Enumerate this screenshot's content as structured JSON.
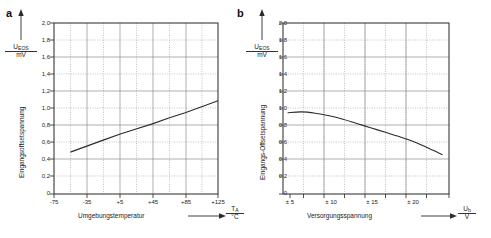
{
  "figure": {
    "panels": [
      {
        "letter": "a",
        "y_axis": {
          "numerator": "U",
          "numerator_sub": "EOS",
          "denominator": "mV",
          "rotated_label": "Eingangsoffsetspannung",
          "ticks": [
            "2,0",
            "1,8",
            "1,6",
            "1,4",
            "1,2",
            "1,0",
            "0,8",
            "0,6",
            "0,4",
            "0,2",
            "0"
          ]
        },
        "x_axis": {
          "label": "Umgebungstemperatur",
          "numerator": "T",
          "numerator_sub": "A",
          "denominator": "°C",
          "ticks": [
            "-75",
            "-35",
            "+5",
            "+45",
            "+85",
            "+125"
          ]
        }
      },
      {
        "letter": "b",
        "y_axis": {
          "numerator": "U",
          "numerator_sub": "EOS",
          "denominator": "mV",
          "rotated_label": "Eingangs-Offsetspannung",
          "ticks": [
            "2,0",
            "1,8",
            "1,6",
            "1,4",
            "1,2",
            "1,0",
            "0,8",
            "0,6",
            "0,4",
            "0,2",
            "0"
          ]
        },
        "x_axis": {
          "label": "Versorgungsspannung",
          "numerator": "U",
          "numerator_sub": "b",
          "denominator": "V",
          "ticks": [
            "± 5",
            "± 10",
            "± 15",
            "± 20"
          ]
        }
      }
    ],
    "colors": {
      "curve": "#2b2b2b",
      "frame": "#3a3a3a",
      "grid": "#9a9a9a",
      "text": "#1a1a1a",
      "background": "#ffffff"
    }
  },
  "chart_data": [
    {
      "type": "line",
      "title": "a",
      "xlabel": "Umgebungstemperatur / T_A / °C",
      "ylabel": "Eingangsoffsetspannung / U_EOS / mV",
      "xlim": [
        -75,
        125
      ],
      "ylim": [
        0,
        2.0
      ],
      "xticks": [
        -75,
        -35,
        5,
        45,
        85,
        125
      ],
      "yticks": [
        0,
        0.2,
        0.4,
        0.6,
        0.8,
        1.0,
        1.2,
        1.4,
        1.6,
        1.8,
        2.0
      ],
      "grid": true,
      "legend": "none",
      "series": [
        {
          "name": "U_EOS vs T_A",
          "x": [
            -55,
            -35,
            -15,
            5,
            25,
            45,
            65,
            85,
            105,
            125
          ],
          "y": [
            0.49,
            0.56,
            0.63,
            0.7,
            0.76,
            0.82,
            0.89,
            0.95,
            1.02,
            1.09
          ]
        }
      ]
    },
    {
      "type": "line",
      "title": "b",
      "xlabel": "Versorgungsspannung / U_b / V",
      "ylabel": "Eingangs-Offsetspannung / U_EOS / mV",
      "xlim": [
        4,
        22
      ],
      "ylim": [
        0,
        2.0
      ],
      "xticks": [
        5,
        10,
        15,
        20
      ],
      "yticks": [
        0,
        0.2,
        0.4,
        0.6,
        0.8,
        1.0,
        1.2,
        1.4,
        1.6,
        1.8,
        2.0
      ],
      "grid": true,
      "legend": "none",
      "series": [
        {
          "name": "U_EOS vs U_b",
          "x": [
            4.5,
            6,
            7.5,
            9,
            10.5,
            12,
            13.5,
            15,
            16.5,
            18,
            19.5,
            21.3
          ],
          "y": [
            0.95,
            0.96,
            0.945,
            0.915,
            0.875,
            0.825,
            0.775,
            0.725,
            0.675,
            0.62,
            0.55,
            0.46
          ]
        }
      ]
    }
  ]
}
